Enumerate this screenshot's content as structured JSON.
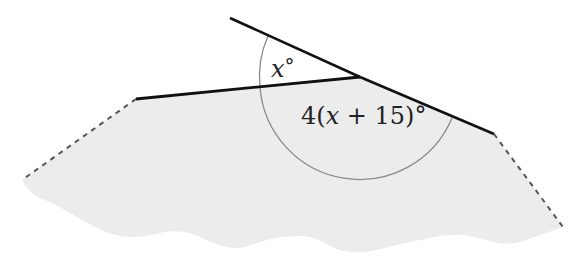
{
  "diagram": {
    "type": "geometry-angles",
    "labels": {
      "small_angle": "x°",
      "small_angle_var": "x",
      "small_angle_deg": "°",
      "large_angle_prefix": "4(",
      "large_angle_var": "x",
      "large_angle_suffix": " + 15)°"
    },
    "colors": {
      "line": "#111111",
      "arc": "#8a8a8a",
      "region_fill": "#ececec",
      "dashed": "#555555",
      "background": "#ffffff"
    },
    "points": {
      "ray_start": [
        230,
        18
      ],
      "vertex": [
        360,
        77
      ],
      "left_end": [
        136,
        99
      ],
      "right_end": [
        494,
        134
      ],
      "left_dash_end": [
        22,
        180
      ],
      "right_dash_end": [
        563,
        227
      ]
    }
  }
}
